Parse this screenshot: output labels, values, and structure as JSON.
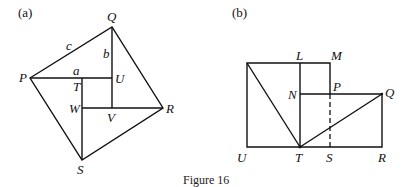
{
  "figure": {
    "caption": "Figure 16",
    "panel_a": {
      "tag": "(a)",
      "points": {
        "P": "P",
        "Q": "Q",
        "R": "R",
        "S": "S",
        "T": "T",
        "U": "U",
        "V": "V",
        "W": "W"
      },
      "side_labels": {
        "a": "a",
        "b": "b",
        "c": "c"
      }
    },
    "panel_b": {
      "tag": "(b)",
      "points": {
        "L": "L",
        "M": "M",
        "N": "N",
        "P": "P",
        "Q": "Q",
        "U": "U",
        "T": "T",
        "S": "S",
        "R": "R"
      }
    }
  }
}
